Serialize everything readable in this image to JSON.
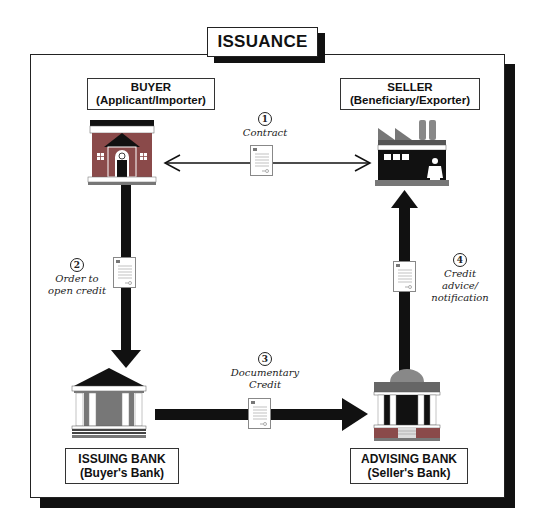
{
  "title": "ISSUANCE",
  "parties": {
    "buyer": {
      "name": "BUYER",
      "role": "(Applicant/Importer)"
    },
    "seller": {
      "name": "SELLER",
      "role": "(Beneficiary/Exporter)"
    },
    "issuing_bank": {
      "name": "ISSUING BANK",
      "role": "(Buyer's Bank)"
    },
    "advising_bank": {
      "name": "ADVISING BANK",
      "role": "(Seller's Bank)"
    }
  },
  "steps": [
    {
      "number": "1",
      "label_line1": "Contract",
      "label_line2": "",
      "label_line3": "",
      "from": "buyer",
      "to": "seller",
      "direction": "both"
    },
    {
      "number": "2",
      "label_line1": "Order to",
      "label_line2": "open credit",
      "label_line3": "",
      "from": "buyer",
      "to": "issuing_bank"
    },
    {
      "number": "3",
      "label_line1": "Documentary",
      "label_line2": "Credit",
      "label_line3": "",
      "from": "issuing_bank",
      "to": "advising_bank"
    },
    {
      "number": "4",
      "label_line1": "Credit",
      "label_line2": "advice/",
      "label_line3": "notification",
      "from": "advising_bank",
      "to": "seller"
    }
  ],
  "icons": {
    "buyer": "house-with-person-icon",
    "seller": "factory-with-worker-icon",
    "issuing_bank": "bank-building-icon",
    "advising_bank": "domed-bank-icon",
    "document": "document-icon"
  },
  "colors": {
    "building_red": "#8a4a4a",
    "roof_gray": "#6d6d6d",
    "dark": "#111111",
    "paper": "#ffffff"
  }
}
